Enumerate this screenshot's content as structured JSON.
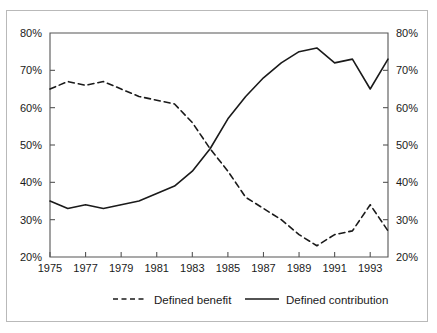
{
  "chart_data": {
    "type": "line",
    "title": "",
    "subtitle": "",
    "xlabel": "",
    "ylabel": "",
    "xlim": [
      1975,
      1994
    ],
    "ylim": [
      20,
      80
    ],
    "grid": false,
    "legend_position": "bottom",
    "y_axis_dual": true,
    "x": [
      1975,
      1976,
      1977,
      1978,
      1979,
      1980,
      1981,
      1982,
      1983,
      1984,
      1985,
      1986,
      1987,
      1988,
      1989,
      1990,
      1991,
      1992,
      1993,
      1994
    ],
    "x_tick_labels": [
      "1975",
      "1977",
      "1979",
      "1981",
      "1983",
      "1985",
      "1987",
      "1989",
      "1991",
      "1993"
    ],
    "x_ticks": [
      1975,
      1977,
      1979,
      1981,
      1983,
      1985,
      1987,
      1989,
      1991,
      1993
    ],
    "y_tick_labels": [
      "20%",
      "30%",
      "40%",
      "50%",
      "60%",
      "70%",
      "80%"
    ],
    "y_ticks": [
      20,
      30,
      40,
      50,
      60,
      70,
      80
    ],
    "y_tick_labels_right": [
      "20%",
      "30%",
      "40%",
      "50%",
      "60%",
      "70%",
      "80%"
    ],
    "series": [
      {
        "name": "Defined benefit",
        "style": "dashed",
        "color": "#1a1a1a",
        "values": [
          65,
          67,
          66,
          67,
          65,
          63,
          62,
          61,
          56,
          49,
          43,
          36,
          33,
          30,
          26,
          23,
          26,
          27,
          34,
          27
        ]
      },
      {
        "name": "Defined contribution",
        "style": "solid",
        "color": "#1a1a1a",
        "values": [
          35,
          33,
          34,
          33,
          34,
          35,
          37,
          39,
          43,
          49,
          57,
          63,
          68,
          72,
          75,
          76,
          72,
          73,
          65,
          73
        ]
      }
    ]
  },
  "legend": {
    "items": [
      {
        "label": "Defined benefit",
        "style": "dashed"
      },
      {
        "label": "Defined contribution",
        "style": "solid"
      }
    ]
  },
  "colors": {
    "line": "#1a1a1a",
    "axis": "#555555",
    "frame": "#b9b9b9",
    "background": "#ffffff",
    "text": "#1a1a1a"
  }
}
